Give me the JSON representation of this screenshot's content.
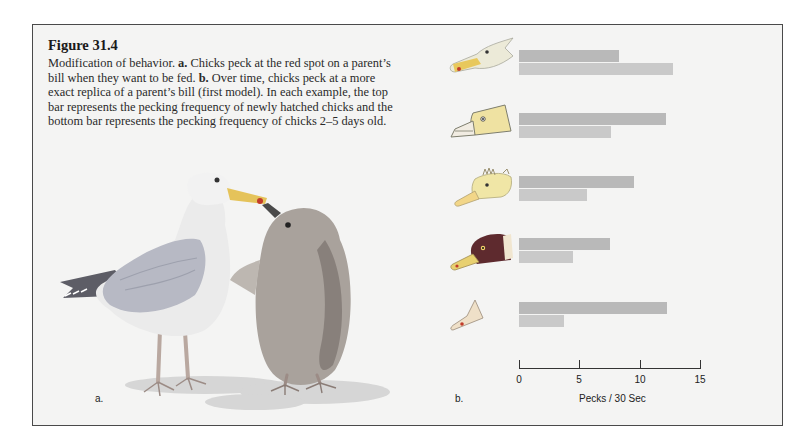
{
  "figure": {
    "title": "Figure 31.4",
    "caption_parts": {
      "p1": "Modification of behavior. ",
      "a_bold": "a.",
      "p2": " Chicks peck at the red spot on a parent’s bill when they want to be fed. ",
      "b_bold": "b.",
      "p3": " Over time, chicks peck at a more exact replica of a parent’s bill (first model). In each example, the top bar represents the pecking frequency of newly hatched chicks and the bottom bar represents the pecking frequency of chicks 2–5 days old."
    },
    "panel_a_label": "a.",
    "panel_b_label": "b."
  },
  "colors": {
    "frame_bg": "#f4f4f3",
    "bar_newly_hatched": "#b9b9b9",
    "bar_2_5_days": "#c9c9c9",
    "frame_border": "#4a4a4a"
  },
  "models": [
    {
      "name": "realistic gull head with red bill spot",
      "icon": "gull-head-icon"
    },
    {
      "name": "simplified gull head model",
      "icon": "model-head-icon"
    },
    {
      "name": "crested head model",
      "icon": "crested-head-icon"
    },
    {
      "name": "dark-headed model",
      "icon": "dark-head-icon"
    },
    {
      "name": "bill-only model",
      "icon": "bill-model-icon"
    }
  ],
  "chart_data": {
    "type": "bar",
    "orientation": "horizontal",
    "title": "",
    "xlabel": "Pecks / 30 Sec",
    "ylabel": "",
    "xlim": [
      0,
      15
    ],
    "xticks": [
      "0",
      "5",
      "10",
      "15"
    ],
    "categories": [
      "Model 1 (realistic gull head)",
      "Model 2 (simplified head)",
      "Model 3 (crested head)",
      "Model 4 (dark head)",
      "Model 5 (bill only)"
    ],
    "series": [
      {
        "name": "Newly hatched chicks (top bar)",
        "values": [
          8.3,
          12.2,
          9.5,
          7.5,
          12.3
        ]
      },
      {
        "name": "Chicks 2–5 days old (bottom bar)",
        "values": [
          12.8,
          7.6,
          5.6,
          4.5,
          3.7
        ]
      }
    ],
    "grid": false,
    "legend": "none (described in caption)"
  }
}
